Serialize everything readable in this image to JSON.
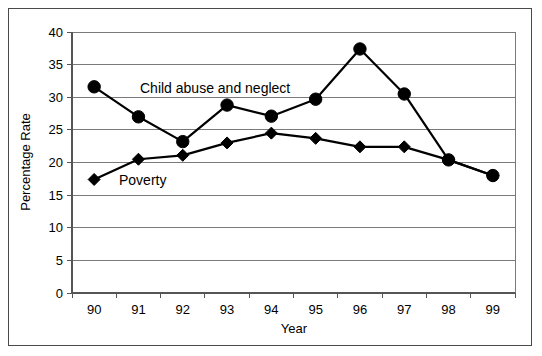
{
  "chart_data": {
    "type": "line",
    "title": "",
    "xlabel": "Year",
    "ylabel": "Percentage Rate",
    "categories": [
      "90",
      "91",
      "92",
      "93",
      "94",
      "95",
      "96",
      "97",
      "98",
      "99"
    ],
    "ylim": [
      0,
      40
    ],
    "ytick_labels": [
      "0",
      "5",
      "10",
      "15",
      "20",
      "25",
      "30",
      "35",
      "40"
    ],
    "ytick_values": [
      0,
      5,
      10,
      15,
      20,
      25,
      30,
      35,
      40
    ],
    "grid": "horizontal",
    "legend_position": "inline-annotation",
    "series": [
      {
        "name": "Child abuse and neglect",
        "marker": "circle",
        "values": [
          31.6,
          27.0,
          23.2,
          28.8,
          27.1,
          29.7,
          37.4,
          30.5,
          20.4,
          18.0
        ]
      },
      {
        "name": "Poverty",
        "marker": "diamond",
        "values": [
          17.4,
          20.5,
          21.1,
          23.0,
          24.5,
          23.7,
          22.4,
          22.4,
          20.4,
          18.0
        ]
      }
    ],
    "annotations": [
      {
        "text": "Child abuse and neglect",
        "series": "Child abuse and neglect"
      },
      {
        "text": "Poverty",
        "series": "Poverty"
      }
    ]
  },
  "colors": {
    "series_line": "#000000",
    "marker_fill": "#000000",
    "gridline": "#7a7a7a",
    "axis": "#555555",
    "frame": "#4a4a4a",
    "background": "#ffffff"
  }
}
